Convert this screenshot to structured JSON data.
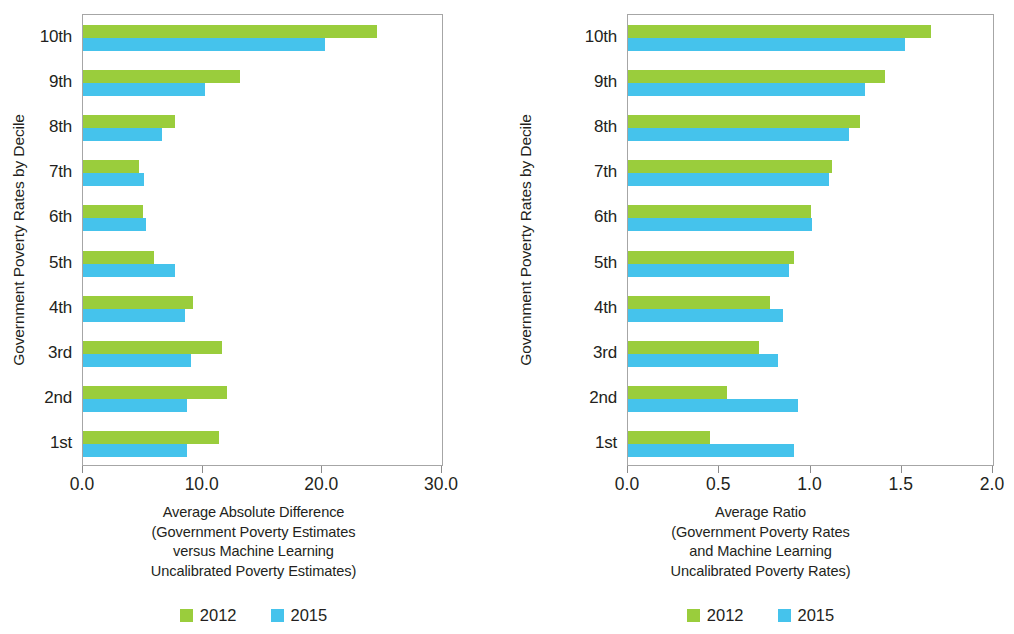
{
  "chart_data": [
    {
      "type": "bar",
      "orientation": "horizontal",
      "panel": "left",
      "title": "",
      "xlabel": "Average Absolute Difference\n(Government Poverty Estimates\nversus Machine Learning\nUncalibrated Poverty Estimates)",
      "xlabel_lines": [
        "Average Absolute Difference",
        "(Government Poverty Estimates",
        "versus Machine Learning",
        "Uncalibrated Poverty Estimates)"
      ],
      "ylabel": "Government Poverty Rates by Decile",
      "categories": [
        "10th",
        "9th",
        "8th",
        "7th",
        "6th",
        "5th",
        "4th",
        "3rd",
        "2nd",
        "1st"
      ],
      "xlim": [
        0.0,
        30.0
      ],
      "xticks": [
        0.0,
        10.0,
        20.0,
        30.0
      ],
      "xticklabels": [
        "0.0",
        "10.0",
        "20.0",
        "30.0"
      ],
      "grid": false,
      "legend_position": "bottom",
      "series": [
        {
          "name": "2012",
          "color": "#9acd3c",
          "values": [
            24.6,
            13.1,
            7.7,
            4.7,
            5.0,
            5.9,
            9.2,
            11.6,
            12.0,
            11.4
          ]
        },
        {
          "name": "2015",
          "color": "#45c3ec",
          "values": [
            20.2,
            10.2,
            6.6,
            5.1,
            5.3,
            7.7,
            8.5,
            9.0,
            8.7,
            8.7
          ]
        }
      ]
    },
    {
      "type": "bar",
      "orientation": "horizontal",
      "panel": "right",
      "title": "",
      "xlabel": "Average Ratio\n(Government Poverty Rates\nand Machine Learning\nUncalibrated Poverty Rates)",
      "xlabel_lines": [
        "Average Ratio",
        "(Government Poverty Rates",
        "and Machine Learning",
        "Uncalibrated Poverty Rates)"
      ],
      "ylabel": "Government Poverty Rates by Decile",
      "categories": [
        "10th",
        "9th",
        "8th",
        "7th",
        "6th",
        "5th",
        "4th",
        "3rd",
        "2nd",
        "1st"
      ],
      "xlim": [
        0.0,
        2.0
      ],
      "xticks": [
        0.0,
        0.5,
        1.0,
        1.5,
        2.0
      ],
      "xticklabels": [
        "0.0",
        "0.5",
        "1.0",
        "1.5",
        "2.0"
      ],
      "grid": false,
      "legend_position": "bottom",
      "series": [
        {
          "name": "2012",
          "color": "#9acd3c",
          "values": [
            1.66,
            1.41,
            1.27,
            1.12,
            1.0,
            0.91,
            0.78,
            0.72,
            0.54,
            0.45
          ]
        },
        {
          "name": "2015",
          "color": "#45c3ec",
          "values": [
            1.52,
            1.3,
            1.21,
            1.1,
            1.01,
            0.88,
            0.85,
            0.82,
            0.93,
            0.91
          ]
        }
      ]
    }
  ],
  "left_panel": {
    "ylabel": "Government Poverty Rates by Decile",
    "categories": [
      "10th",
      "9th",
      "8th",
      "7th",
      "6th",
      "5th",
      "4th",
      "3rd",
      "2nd",
      "1st"
    ],
    "xticklabels": [
      "0.0",
      "10.0",
      "20.0",
      "30.0"
    ],
    "caption": {
      "line1": "Average Absolute Difference",
      "line2": "(Government Poverty Estimates",
      "line3": "versus Machine Learning",
      "line4": "Uncalibrated Poverty Estimates)"
    },
    "legend": [
      {
        "label": "2012",
        "color": "#9acd3c"
      },
      {
        "label": "2015",
        "color": "#45c3ec"
      }
    ]
  },
  "right_panel": {
    "ylabel": "Government Poverty Rates by Decile",
    "categories": [
      "10th",
      "9th",
      "8th",
      "7th",
      "6th",
      "5th",
      "4th",
      "3rd",
      "2nd",
      "1st"
    ],
    "xticklabels": [
      "0.0",
      "0.5",
      "1.0",
      "1.5",
      "2.0"
    ],
    "caption": {
      "line1": "Average Ratio",
      "line2": "(Government Poverty Rates",
      "line3": "and Machine Learning",
      "line4": "Uncalibrated Poverty Rates)"
    },
    "legend": [
      {
        "label": "2012",
        "color": "#9acd3c"
      },
      {
        "label": "2015",
        "color": "#45c3ec"
      }
    ]
  },
  "colors": {
    "series_2012": "#9acd3c",
    "series_2015": "#45c3ec",
    "axis": "#a6a6a6",
    "text": "#231f20",
    "background": "#ffffff"
  }
}
